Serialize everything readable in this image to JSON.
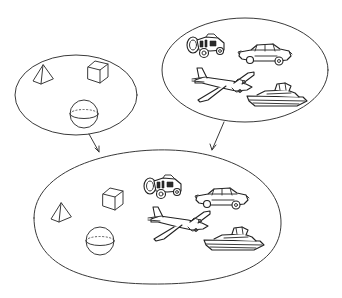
{
  "diagram": {
    "sets": [
      {
        "id": "set-a",
        "name": "geometric solids",
        "members": [
          "pyramid",
          "cube",
          "sphere"
        ]
      },
      {
        "id": "set-b",
        "name": "vehicles",
        "members": [
          "tractor",
          "car",
          "airplane",
          "boat"
        ]
      },
      {
        "id": "set-union",
        "name": "union of both sets",
        "members": [
          "pyramid",
          "cube",
          "sphere",
          "tractor",
          "car",
          "airplane",
          "boat"
        ]
      }
    ],
    "arrows": [
      {
        "from": "set-a",
        "to": "set-union"
      },
      {
        "from": "set-b",
        "to": "set-union"
      }
    ],
    "colors": {
      "line": "#3a3a3a",
      "background": "#ffffff"
    }
  }
}
